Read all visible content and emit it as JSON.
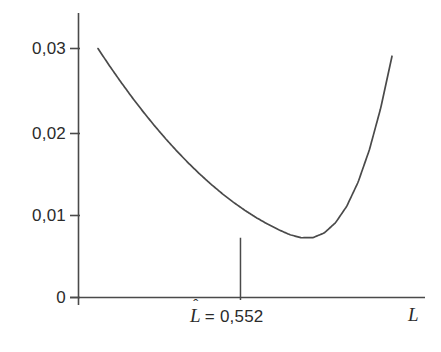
{
  "figure": {
    "background_color": "#ffffff",
    "line_color": "#4a4a4a",
    "text_color": "#2b2b2b"
  },
  "axes": {
    "y_tick_labels": [
      "0,03",
      "0,02",
      "0,01",
      "0"
    ],
    "x_axis_label": "L",
    "x_axis_label_name": "L"
  },
  "annotation": {
    "estimate_symbol": "L",
    "estimate_hat": "ˆ",
    "estimate_equals": "=",
    "estimate_value": "0,552",
    "estimate_full_text": "L̂ = 0,552"
  },
  "chart_data": {
    "type": "line",
    "title": "",
    "subtitle": "",
    "xlabel": "L",
    "ylabel": "",
    "xlim": [
      0.3,
      0.82
    ],
    "ylim": [
      0,
      0.0335
    ],
    "grid": false,
    "legend": null,
    "y_ticks": [
      0,
      0.01,
      0.02,
      0.03
    ],
    "y_tick_labels": [
      "0",
      "0,01",
      "0,02",
      "0,03"
    ],
    "x_ticks": [
      0.552
    ],
    "x_tick_labels": [
      "L̂ = 0,552"
    ],
    "minimum": {
      "x": 0.552,
      "y": 0.0072
    },
    "annotations": [
      {
        "type": "vertical-drop-line",
        "x": 0.552,
        "y_from": 0.0072,
        "y_to": 0,
        "label": "L̂ = 0,552"
      }
    ],
    "series": [
      {
        "name": "objective function",
        "x": [
          0.3,
          0.32,
          0.34,
          0.36,
          0.38,
          0.4,
          0.42,
          0.44,
          0.46,
          0.48,
          0.5,
          0.52,
          0.54,
          0.552,
          0.56,
          0.58,
          0.6,
          0.62,
          0.64,
          0.66,
          0.68,
          0.7,
          0.72,
          0.74,
          0.76,
          0.78,
          0.8,
          0.82
        ],
        "y": [
          0.02999,
          0.02795,
          0.026,
          0.02414,
          0.02237,
          0.02069,
          0.0191,
          0.0176,
          0.01619,
          0.01487,
          0.01364,
          0.0125,
          0.01145,
          0.01088,
          0.01049,
          0.00962,
          0.00884,
          0.00815,
          0.00755,
          0.0072,
          0.00721,
          0.00777,
          0.009,
          0.011,
          0.01389,
          0.01779,
          0.02281,
          0.02907
        ]
      }
    ]
  }
}
